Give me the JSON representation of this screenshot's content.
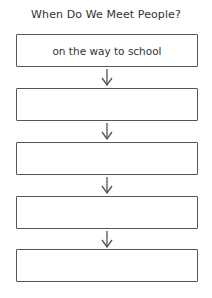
{
  "diagram": {
    "title": "When Do We Meet People?",
    "boxes": [
      {
        "text": "on the way to school"
      },
      {
        "text": ""
      },
      {
        "text": ""
      },
      {
        "text": ""
      },
      {
        "text": ""
      }
    ],
    "line_color": "#555555",
    "text_color": "#333333"
  }
}
